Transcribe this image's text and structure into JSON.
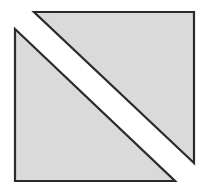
{
  "figure": {
    "canvas": {
      "width": 208,
      "height": 189,
      "background": "#ffffff"
    },
    "style": {
      "fill": "#dadada",
      "stroke": "#2b2b2b",
      "stroke_width": 2.2,
      "gap_color": "#ffffff"
    },
    "shapes": [
      {
        "name": "upper-right-triangle",
        "kind": "right-triangle",
        "right_angle_at": "top-right",
        "points": "34,12 194,12 194,163",
        "vertices": [
          {
            "label": "A",
            "x": 34,
            "y": 12
          },
          {
            "label": "B",
            "x": 194,
            "y": 12
          },
          {
            "label": "C",
            "x": 194,
            "y": 163
          }
        ],
        "legs": {
          "horizontal": 160,
          "vertical": 151
        }
      },
      {
        "name": "lower-left-triangle",
        "kind": "right-triangle",
        "right_angle_at": "bottom-left",
        "points": "15,29 175,181 15,181",
        "vertices": [
          {
            "label": "D",
            "x": 15,
            "y": 29
          },
          {
            "label": "E",
            "x": 175,
            "y": 181
          },
          {
            "label": "F",
            "x": 15,
            "y": 181
          }
        ],
        "legs": {
          "horizontal": 160,
          "vertical": 152
        }
      }
    ],
    "offset": {
      "dx": -19,
      "dy": 17
    },
    "diagonal_gap": {
      "present": true,
      "color": "#ffffff",
      "approx_width_px": 12
    }
  }
}
